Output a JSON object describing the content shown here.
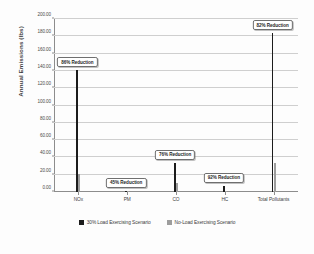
{
  "chart_data": {
    "type": "bar",
    "title": "",
    "xlabel": "",
    "ylabel": "Annual Emissions (lbs)",
    "ylim": [
      0,
      200
    ],
    "ytick_step": 20,
    "ytick_labels": [
      "0.00",
      "20.00",
      "40.00",
      "60.00",
      "80.00",
      "100.00",
      "120.00",
      "140.00",
      "160.00",
      "180.00",
      "200.00"
    ],
    "ytick_values": [
      0,
      20,
      40,
      60,
      80,
      100,
      120,
      140,
      160,
      180,
      200
    ],
    "grid": true,
    "legend_position": "bottom",
    "categories": [
      "NOx",
      "PM",
      "CO",
      "HC",
      "Total Pollutants"
    ],
    "series": [
      {
        "name": "30% Load Exercising Scenario",
        "color": "#1c1c1c",
        "values": [
          141.0,
          1.2,
          34.0,
          7.5,
          183.7
        ]
      },
      {
        "name": "No-Load Exercising Scenario",
        "color": "#9d9d9d",
        "values": [
          21.0,
          0.7,
          11.0,
          0.6,
          33.3
        ]
      }
    ],
    "annotations": [
      {
        "category": "NOx",
        "text": "86% Reduction"
      },
      {
        "category": "PM",
        "text": "45% Reduction"
      },
      {
        "category": "CO",
        "text": "76% Reduction"
      },
      {
        "category": "HC",
        "text": "92% Reduction"
      },
      {
        "category": "Total Pollutants",
        "text": "82% Reduction"
      }
    ]
  }
}
